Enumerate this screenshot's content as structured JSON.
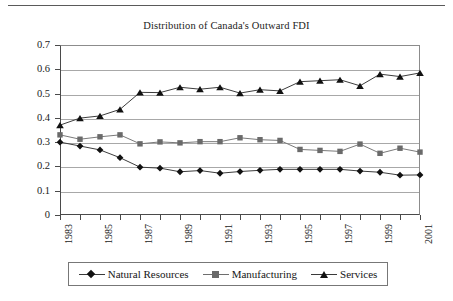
{
  "chart_data": {
    "type": "line",
    "title": "Distribution of Canada's Outward FDI",
    "xlabel": "",
    "ylabel": "",
    "ylim": [
      0,
      0.7
    ],
    "ytick_step": 0.1,
    "yticks": [
      "0.7",
      "0.6",
      "0.5",
      "0.4",
      "0.3",
      "0.2",
      "0.1",
      "0"
    ],
    "grid": true,
    "legend_position": "bottom",
    "x": [
      1983,
      1984,
      1985,
      1986,
      1987,
      1988,
      1989,
      1990,
      1991,
      1992,
      1993,
      1994,
      1995,
      1996,
      1997,
      1998,
      1999,
      2000,
      2001
    ],
    "xtick_labels": [
      "1983",
      "",
      "1985",
      "",
      "1987",
      "",
      "1989",
      "",
      "1991",
      "",
      "1993",
      "",
      "1995",
      "",
      "1997",
      "",
      "1999",
      "",
      "2001"
    ],
    "series": [
      {
        "name": "Natural Resources",
        "marker": "diamond",
        "color": "#111111",
        "values": [
          0.3,
          0.284,
          0.268,
          0.236,
          0.197,
          0.193,
          0.178,
          0.183,
          0.172,
          0.179,
          0.184,
          0.188,
          0.188,
          0.188,
          0.188,
          0.181,
          0.176,
          0.164,
          0.165
        ]
      },
      {
        "name": "Manufacturing",
        "marker": "square",
        "color": "#6a6a6a",
        "values": [
          0.33,
          0.312,
          0.322,
          0.33,
          0.293,
          0.301,
          0.297,
          0.302,
          0.302,
          0.318,
          0.31,
          0.307,
          0.27,
          0.266,
          0.262,
          0.292,
          0.254,
          0.275,
          0.259
        ]
      },
      {
        "name": "Services",
        "marker": "triangle",
        "color": "#111111",
        "values": [
          0.37,
          0.399,
          0.408,
          0.435,
          0.505,
          0.504,
          0.526,
          0.518,
          0.526,
          0.502,
          0.516,
          0.511,
          0.549,
          0.553,
          0.557,
          0.532,
          0.58,
          0.57,
          0.585
        ]
      }
    ]
  },
  "legend": {
    "entries": [
      {
        "label": "Natural Resources"
      },
      {
        "label": "Manufacturing"
      },
      {
        "label": "Services"
      }
    ]
  }
}
